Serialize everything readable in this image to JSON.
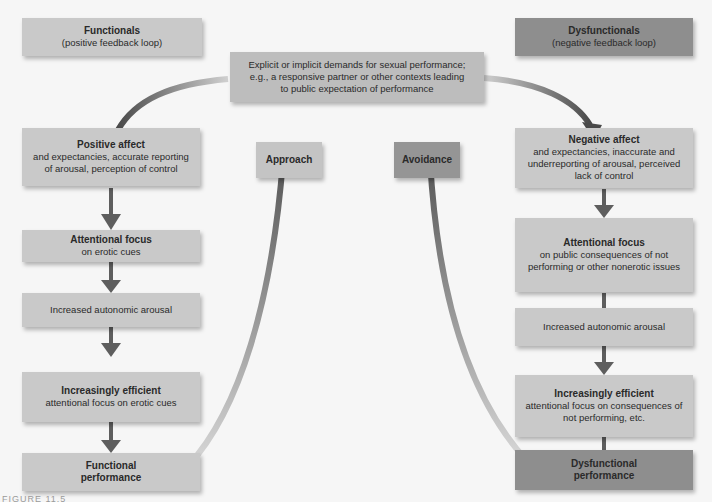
{
  "header": {
    "functionals": {
      "title": "Functionals",
      "subtitle": "(positive feedback loop)"
    },
    "dysfunctionals": {
      "title": "Dysfunctionals",
      "subtitle": "(negative feedback loop)"
    },
    "demands": {
      "line1": "Explicit or implicit demands for sexual performance;",
      "line2": "e.g., a responsive partner or other contexts leading",
      "line3": "to public expectation of performance"
    }
  },
  "labels": {
    "approach": "Approach",
    "avoidance": "Avoidance"
  },
  "left_column": [
    {
      "title": "Positive affect",
      "body": "and expectancies, accurate reporting of arousal, perception of control"
    },
    {
      "title": "Attentional focus",
      "body": "on erotic cues"
    },
    {
      "title": "",
      "body": "Increased autonomic arousal"
    },
    {
      "title": "Increasingly efficient",
      "body": "attentional focus on erotic cues"
    },
    {
      "title": "Functional performance",
      "body": ""
    }
  ],
  "right_column": [
    {
      "title": "Negative affect",
      "body": "and expectancies, inaccurate and underreporting of arousal, perceived lack of control"
    },
    {
      "title": "Attentional focus",
      "body": "on public consequences of not performing or other nonerotic issues"
    },
    {
      "title": "",
      "body": "Increased autonomic arousal"
    },
    {
      "title": "Increasingly efficient",
      "body": "attentional focus on consequences of not performing, etc."
    },
    {
      "title": "Dysfunctional performance",
      "body": ""
    }
  ],
  "caption": "FIGURE 11.5",
  "colors": {
    "background": "#f6f6f6",
    "light_box": "#c9c9c9",
    "dark_box": "#8e8e8e",
    "arrow": "#5e5e5e"
  }
}
